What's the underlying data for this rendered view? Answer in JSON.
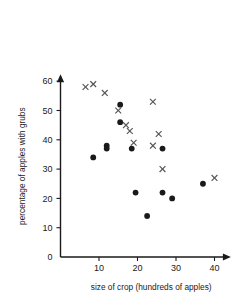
{
  "chart_data": {
    "type": "scatter",
    "title": "",
    "xlabel": "size of crop (hundreds of apples)",
    "ylabel": "percentage of apples with grubs",
    "xlim": [
      0,
      44
    ],
    "ylim": [
      0,
      62
    ],
    "xticks": [
      10,
      20,
      30,
      40
    ],
    "yticks": [
      0,
      10,
      20,
      30,
      40,
      50,
      60
    ],
    "grid": false,
    "legend_position": "none",
    "series": [
      {
        "name": "filled-circles",
        "marker": "circle",
        "color": "#1a1a1a",
        "points": [
          {
            "x": 8.5,
            "y": 34
          },
          {
            "x": 12,
            "y": 38
          },
          {
            "x": 12,
            "y": 37
          },
          {
            "x": 15.5,
            "y": 52
          },
          {
            "x": 15.5,
            "y": 46
          },
          {
            "x": 18.5,
            "y": 37
          },
          {
            "x": 19.5,
            "y": 22
          },
          {
            "x": 22.5,
            "y": 14
          },
          {
            "x": 26.5,
            "y": 37
          },
          {
            "x": 26.5,
            "y": 22
          },
          {
            "x": 29,
            "y": 20
          },
          {
            "x": 37,
            "y": 25
          }
        ]
      },
      {
        "name": "crosses",
        "marker": "cross",
        "color": "#555555",
        "points": [
          {
            "x": 6.5,
            "y": 58
          },
          {
            "x": 8.5,
            "y": 59
          },
          {
            "x": 11.5,
            "y": 56
          },
          {
            "x": 15,
            "y": 50
          },
          {
            "x": 17,
            "y": 45
          },
          {
            "x": 18,
            "y": 43
          },
          {
            "x": 19,
            "y": 39
          },
          {
            "x": 24,
            "y": 53
          },
          {
            "x": 24,
            "y": 38
          },
          {
            "x": 25.5,
            "y": 42
          },
          {
            "x": 26.5,
            "y": 30
          },
          {
            "x": 40,
            "y": 27
          }
        ]
      }
    ]
  }
}
